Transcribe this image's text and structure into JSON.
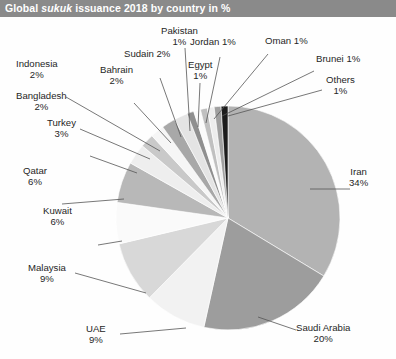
{
  "header": {
    "title_pre": "Global ",
    "title_em": "sukuk",
    "title_post": " issuance 2018 by country in %",
    "title_full": "Global sukuk issuance 2018 by country in %",
    "bar_color": "#8a8a8a",
    "text_color": "#ffffff"
  },
  "chart_data": {
    "type": "pie",
    "title": "Global sukuk issuance 2018 by country in %",
    "unit": "%",
    "legend": "none",
    "labels_layout": "leader-lines-outside",
    "start_angle_deg": 0,
    "direction": "clockwise",
    "categories": [
      "Iran",
      "Saudi Arabia",
      "UAE",
      "Malaysia",
      "Kuwait",
      "Qatar",
      "Turkey",
      "Bangladesh",
      "Indonesia",
      "Bahrain",
      "Sudain",
      "Pakistan",
      "Egypt",
      "Jordan",
      "Oman",
      "Brunei",
      "Others"
    ],
    "values": [
      34,
      20,
      9,
      9,
      6,
      6,
      3,
      2,
      2,
      2,
      2,
      1,
      1,
      1,
      1,
      1,
      1
    ],
    "slices": [
      {
        "name": "Iran",
        "value": 34,
        "label": "Iran",
        "value_label": "34%",
        "color": "#b3b3b3"
      },
      {
        "name": "Saudi Arabia",
        "value": 20,
        "label": "Saudi Arabia",
        "value_label": "20%",
        "color": "#9d9d9d"
      },
      {
        "name": "UAE",
        "value": 9,
        "label": "UAE",
        "value_label": "9%",
        "color": "#f2f2f2"
      },
      {
        "name": "Malaysia",
        "value": 9,
        "label": "Malaysia",
        "value_label": "9%",
        "color": "#d8d8d8"
      },
      {
        "name": "Kuwait",
        "value": 6,
        "label": "Kuwait",
        "value_label": "6%",
        "color": "#fafafa"
      },
      {
        "name": "Qatar",
        "value": 6,
        "label": "Qatar",
        "value_label": "6%",
        "color": "#b8b8b8"
      },
      {
        "name": "Turkey",
        "value": 3,
        "label": "Turkey",
        "value_label": "3%",
        "color": "#eeeeee"
      },
      {
        "name": "Bangladesh",
        "value": 2,
        "label": "Bangladesh",
        "value_label": "2%",
        "color": "#c9c9c9"
      },
      {
        "name": "Indonesia",
        "value": 2,
        "label": "Indonesia",
        "value_label": "2%",
        "color": "#f6f6f6"
      },
      {
        "name": "Bahrain",
        "value": 2,
        "label": "Bahrain",
        "value_label": "2%",
        "color": "#a8a8a8"
      },
      {
        "name": "Sudain",
        "value": 2,
        "label": "Sudain",
        "value_label": "2%",
        "color": "#e4e4e4"
      },
      {
        "name": "Pakistan",
        "value": 1,
        "label": "Pakistan",
        "value_label": "1%",
        "color": "#8f8f8f"
      },
      {
        "name": "Egypt",
        "value": 1,
        "label": "Egypt",
        "value_label": "1%",
        "color": "#fbfbfb"
      },
      {
        "name": "Jordan",
        "value": 1,
        "label": "Jordan",
        "value_label": "1%",
        "color": "#c0c0c0"
      },
      {
        "name": "Oman",
        "value": 1,
        "label": "Oman",
        "value_label": "1%",
        "color": "#ededed"
      },
      {
        "name": "Brunei",
        "value": 1,
        "label": "Brunei",
        "value_label": "1%",
        "color": "#a0a0a0"
      },
      {
        "name": "Others",
        "value": 1,
        "label": "Others",
        "value_label": "1%",
        "color": "#1c1c1c"
      }
    ]
  },
  "labels": {
    "iran": {
      "name": "Iran",
      "value": "34%"
    },
    "saudi_arabia": {
      "name": "Saudi Arabia",
      "value": "20%"
    },
    "uae": {
      "name": "UAE",
      "value": "9%"
    },
    "malaysia": {
      "name": "Malaysia",
      "value": "9%"
    },
    "kuwait": {
      "name": "Kuwait",
      "value": "6%"
    },
    "qatar": {
      "name": "Qatar",
      "value": "6%"
    },
    "turkey": {
      "name": "Turkey",
      "value": "3%"
    },
    "bangladesh": {
      "name": "Bangladesh",
      "value": "2%"
    },
    "indonesia": {
      "name": "Indonesia",
      "value": "2%"
    },
    "bahrain": {
      "name": "Bahrain",
      "value": "2%"
    },
    "sudain": {
      "name": "Sudain 2%"
    },
    "pakistan": {
      "name": "Pakistan",
      "value": "1%"
    },
    "egypt": {
      "name": "Egypt",
      "value": "1%"
    },
    "jordan": {
      "name": "Jordan 1%"
    },
    "oman": {
      "name": "Oman 1%"
    },
    "brunei": {
      "name": "Brunei 1%"
    },
    "others": {
      "name": "Others",
      "value": "1%"
    }
  }
}
